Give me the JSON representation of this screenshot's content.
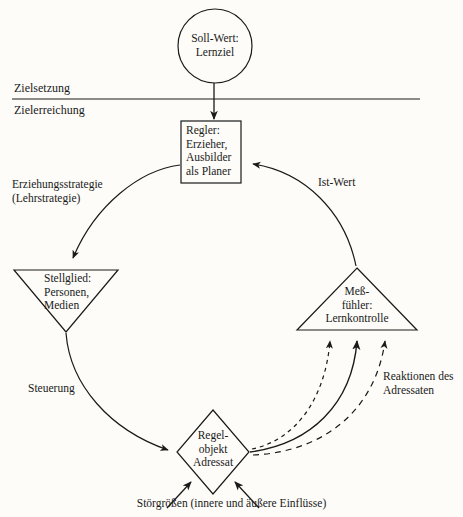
{
  "diagram": {
    "background_color": "#fdfcf8",
    "line_color": "#1a1a1a",
    "zones": {
      "above_label": "Zielsetzung",
      "below_label": "Zielerreichung"
    },
    "nodes": [
      {
        "id": "soll-wert",
        "shape": "circle",
        "text": "Soll-Wert:\nLernziel",
        "cx": 215,
        "cy": 46,
        "r": 37
      },
      {
        "id": "regler",
        "shape": "rectangle",
        "text": "Regler:\nErzieher,\nAusbilder\nals Planer",
        "x": 181,
        "y": 121,
        "w": 60,
        "h": 62
      },
      {
        "id": "stellglied",
        "shape": "triangle-down",
        "text": "Stellglied:\nPersonen,\nMedien",
        "cx": 66,
        "top": 270,
        "half_width": 52,
        "height": 62
      },
      {
        "id": "messfuehler",
        "shape": "triangle-up",
        "text": "Meß-\nfühler:\nLernkontrolle",
        "cx": 357,
        "base_y": 330,
        "half_width": 60,
        "height": 62
      },
      {
        "id": "regelobjekt",
        "shape": "diamond",
        "text": "Regel-\nobjekt\nAdressat",
        "cx": 213,
        "cy": 452,
        "half_width": 36,
        "half_height": 42
      }
    ],
    "edge_labels": [
      {
        "id": "erziehungsstrategie",
        "text": "Erziehungsstrategie\n(Lehrstrategie)",
        "x": 12,
        "y": 177
      },
      {
        "id": "ist-wert",
        "text": "Ist-Wert",
        "x": 318,
        "y": 175
      },
      {
        "id": "steuerung",
        "text": "Steuerung",
        "x": 28,
        "y": 381
      },
      {
        "id": "reaktionen",
        "text": "Reaktionen des\nAdressaten",
        "x": 383,
        "y": 369
      }
    ],
    "caption": "Störgrößen (innere und äußere Einflüsse)"
  }
}
